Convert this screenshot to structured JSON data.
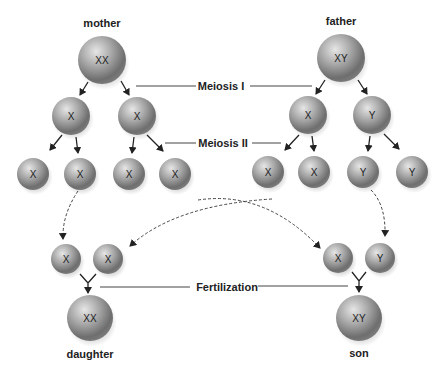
{
  "diagram": {
    "title_labels": {
      "mother": "mother",
      "father": "father",
      "daughter": "daughter",
      "son": "son"
    },
    "stages": {
      "meiosis1": "Meiosis I",
      "meiosis2": "Meiosis II",
      "fertilization": "Fertilization"
    },
    "cells": {
      "mother": "XX",
      "father": "XY",
      "mother_l2": [
        "X",
        "X"
      ],
      "father_l2": [
        "X",
        "Y"
      ],
      "mother_l3": [
        "X",
        "X",
        "X",
        "X"
      ],
      "father_l3": [
        "X",
        "X",
        "Y",
        "Y"
      ],
      "daughter_gametes": [
        "X",
        "X"
      ],
      "son_gametes": [
        "X",
        "Y"
      ],
      "daughter": "XX",
      "son": "XY"
    },
    "colors": {
      "cell_light": "#d8d8d8",
      "cell_dark": "#6a6a6a",
      "line": "#333333"
    }
  }
}
